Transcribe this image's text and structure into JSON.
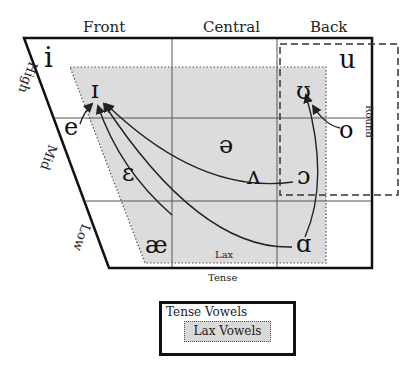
{
  "diagram": {
    "columns": [
      "Front",
      "Central",
      "Back"
    ],
    "rows": [
      "High",
      "Mid",
      "Low"
    ],
    "round_label": "Round",
    "lax_region_label": "Lax",
    "tense_label": "Tense",
    "vowels": {
      "i": "i",
      "u": "u",
      "I": "ɪ",
      "U": "ʊ",
      "e": "e",
      "o": "o",
      "schwa": "ə",
      "epsilon": "ɛ",
      "wedge": "ʌ",
      "open_o": "ɔ",
      "ae": "æ",
      "a": "ɑ"
    },
    "arrows": [
      {
        "from": "e",
        "to": "ɪ"
      },
      {
        "from": "ɛ",
        "to": "ɪ"
      },
      {
        "from": "ɔ",
        "to": "ɪ"
      },
      {
        "from": "ɑ",
        "to": "ɪ"
      },
      {
        "from": "o",
        "to": "ʊ"
      },
      {
        "from": "ɑ",
        "to": "ʊ"
      }
    ],
    "colors": {
      "outline": "#111111",
      "grid": "#555555",
      "lax_fill": "#d9d9d9"
    }
  },
  "legend": {
    "tense_label": "Tense Vowels",
    "lax_label": "Lax Vowels"
  }
}
